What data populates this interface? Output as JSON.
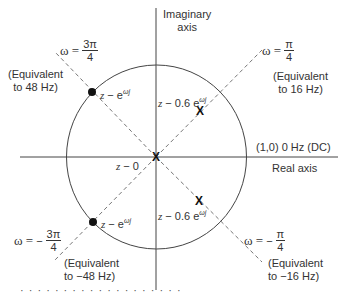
{
  "diagram": {
    "type": "z-plane unit circle",
    "axes": {
      "imaginary_label_line1": "Imaginary",
      "imaginary_label_line2": "axis",
      "real_label": "Real axis",
      "dc_label": "(1,0) 0 Hz (DC)"
    },
    "rays": [
      {
        "id": "pi-over-4",
        "omega_label": "ω =",
        "sign": "",
        "num": "π",
        "den": "4",
        "equiv_line1": "(Equivalent",
        "equiv_line2": "to 16 Hz)"
      },
      {
        "id": "3pi-over-4",
        "omega_label": "ω =",
        "sign": "",
        "num": "3π",
        "den": "4",
        "equiv_line1": "(Equivalent",
        "equiv_line2": "to 48 Hz)"
      },
      {
        "id": "neg-3pi-over-4",
        "omega_label": "ω =",
        "sign": "−",
        "num": "3π",
        "den": "4",
        "equiv_line1": "(Equivalent",
        "equiv_line2": "to −48 Hz)"
      },
      {
        "id": "neg-pi-over-4",
        "omega_label": "ω =",
        "sign": "−",
        "num": "π",
        "den": "4",
        "equiv_line1": "(Equivalent",
        "equiv_line2": "to −16 Hz)"
      }
    ],
    "zeros": [
      {
        "label_z": "z",
        "label_rest": " − e",
        "sup": "ωj"
      },
      {
        "label_z": "z",
        "label_rest": " − e",
        "sup": "ωj"
      }
    ],
    "poles": [
      {
        "label_z": "z",
        "label_rest": " − 0.6 e",
        "sup": "ωj"
      },
      {
        "label_z": "z",
        "label_rest": " − 0",
        "sup": ""
      },
      {
        "label_z": "z",
        "label_rest": " − 0.6 e",
        "sup": "ωj"
      }
    ],
    "pole_marker": "X",
    "caption_fragment": "· · · · · · · · · · · · · · · · · · ·"
  },
  "colors": {
    "line": "#444444",
    "dash": "#666666",
    "marker": "#111111"
  }
}
